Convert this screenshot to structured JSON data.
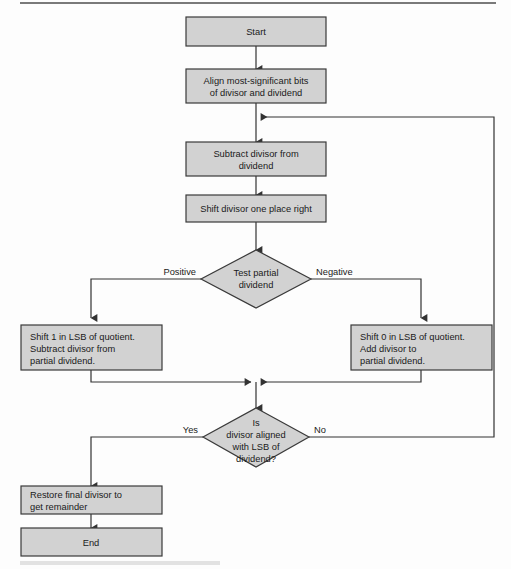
{
  "diagram": {
    "type": "flowchart",
    "colors": {
      "node_fill": "#d2d2d2",
      "node_stroke": "#3a3a3a",
      "edge": "#333333",
      "text": "#1a1a1a",
      "rule_top": "#7a7a7a",
      "rule_bottom": "#e2e2e2"
    },
    "nodes": {
      "start": {
        "shape": "rect",
        "lines": [
          "Start"
        ]
      },
      "align": {
        "shape": "rect",
        "lines": [
          "Align most-significant bits",
          "of divisor and dividend"
        ]
      },
      "subtract": {
        "shape": "rect",
        "lines": [
          "Subtract divisor from",
          "dividend"
        ]
      },
      "shift_right": {
        "shape": "rect",
        "lines": [
          "Shift divisor one place right"
        ]
      },
      "test_partial": {
        "shape": "diamond",
        "lines": [
          "Test partial",
          "dividend"
        ]
      },
      "left_action": {
        "shape": "rect",
        "lines": [
          "Shift 1 in LSB of quotient.",
          "Subtract divisor from",
          "partial dividend."
        ]
      },
      "right_action": {
        "shape": "rect",
        "lines": [
          "Shift 0 in LSB of quotient.",
          "Add divisor to",
          "partial dividend."
        ]
      },
      "aligned_test": {
        "shape": "diamond",
        "lines": [
          "Is",
          "divisor aligned",
          "with LSB of",
          "dividend?"
        ]
      },
      "restore": {
        "shape": "rect",
        "lines": [
          "Restore final divisor to",
          "get remainder"
        ]
      },
      "end": {
        "shape": "rect",
        "lines": [
          "End"
        ]
      }
    },
    "edge_labels": {
      "positive": "Positive",
      "negative": "Negative",
      "yes": "Yes",
      "no": "No"
    }
  }
}
